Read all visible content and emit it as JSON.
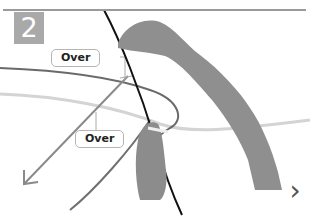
{
  "step": {
    "number": "2"
  },
  "callouts": [
    {
      "label": "Over"
    },
    {
      "label": "Over"
    }
  ],
  "navigation": {
    "next_icon": "chevron-right-icon",
    "next_glyph": "›"
  },
  "colors": {
    "rule": "#9a9a9a",
    "badge_bg": "#a9a9a9",
    "badge_text": "#ffffff",
    "callout_border": "#b5b5b5",
    "cord_dark": "#111111",
    "cord_mid": "#666666",
    "cord_light": "#cfcfcf",
    "arrow": "#8a8a8a",
    "skin": "#8c8c8c"
  }
}
